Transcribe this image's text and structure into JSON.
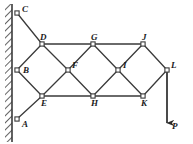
{
  "figure": {
    "type": "truss-diagram",
    "width": 193,
    "height": 144,
    "background": "#ffffff",
    "line_color": "#3a3a3a",
    "label_color": "#1a1a1a",
    "joint_fill": "#ffffff"
  },
  "wall": {
    "name": "fixed-wall",
    "x": 12,
    "top": 4,
    "bottom": 142,
    "thickness": 4,
    "hatch_label": "hatched-support-wall"
  },
  "joints": [
    {
      "id": "A",
      "label": "A",
      "x": 17,
      "y": 119,
      "label_dx": 5,
      "label_dy": 1,
      "support": true
    },
    {
      "id": "B",
      "label": "B",
      "x": 17,
      "y": 70,
      "label_dx": 6,
      "label_dy": -4,
      "support": true
    },
    {
      "id": "C",
      "label": "C",
      "x": 17,
      "y": 13,
      "label_dx": 5,
      "label_dy": -8,
      "support": true
    },
    {
      "id": "D",
      "label": "D",
      "x": 42,
      "y": 44,
      "label_dx": -2,
      "label_dy": -11,
      "support": false
    },
    {
      "id": "E",
      "label": "E",
      "x": 42,
      "y": 96,
      "label_dx": -1,
      "label_dy": 3,
      "support": false
    },
    {
      "id": "F",
      "label": "F",
      "x": 68,
      "y": 70,
      "label_dx": 4,
      "label_dy": -9,
      "support": false
    },
    {
      "id": "G",
      "label": "G",
      "x": 93,
      "y": 44,
      "label_dx": -2,
      "label_dy": -11,
      "support": false
    },
    {
      "id": "H",
      "label": "H",
      "x": 93,
      "y": 96,
      "label_dx": -2,
      "label_dy": 3,
      "support": false
    },
    {
      "id": "I",
      "label": "I",
      "x": 118,
      "y": 70,
      "label_dx": 5,
      "label_dy": -9,
      "support": false
    },
    {
      "id": "J",
      "label": "J",
      "x": 143,
      "y": 44,
      "label_dx": -1,
      "label_dy": -11,
      "support": false
    },
    {
      "id": "K",
      "label": "K",
      "x": 143,
      "y": 96,
      "label_dx": -2,
      "label_dy": 3,
      "support": false
    },
    {
      "id": "L",
      "label": "L",
      "x": 167,
      "y": 70,
      "label_dx": 4,
      "label_dy": -9,
      "support": false
    }
  ],
  "members": [
    {
      "from": "C",
      "to": "D"
    },
    {
      "from": "B",
      "to": "D"
    },
    {
      "from": "B",
      "to": "E"
    },
    {
      "from": "A",
      "to": "E"
    },
    {
      "from": "D",
      "to": "F"
    },
    {
      "from": "E",
      "to": "F"
    },
    {
      "from": "D",
      "to": "G"
    },
    {
      "from": "E",
      "to": "H"
    },
    {
      "from": "F",
      "to": "G"
    },
    {
      "from": "F",
      "to": "H"
    },
    {
      "from": "G",
      "to": "I"
    },
    {
      "from": "H",
      "to": "I"
    },
    {
      "from": "G",
      "to": "J"
    },
    {
      "from": "H",
      "to": "K"
    },
    {
      "from": "I",
      "to": "J"
    },
    {
      "from": "I",
      "to": "K"
    },
    {
      "from": "J",
      "to": "L"
    },
    {
      "from": "K",
      "to": "L"
    }
  ],
  "load": {
    "name": "applied-load-P",
    "label": "P",
    "from_joint": "L",
    "x": 167,
    "y_start": 70,
    "y_end": 130,
    "direction": "down",
    "label_dx": 5,
    "label_dy": -8
  }
}
